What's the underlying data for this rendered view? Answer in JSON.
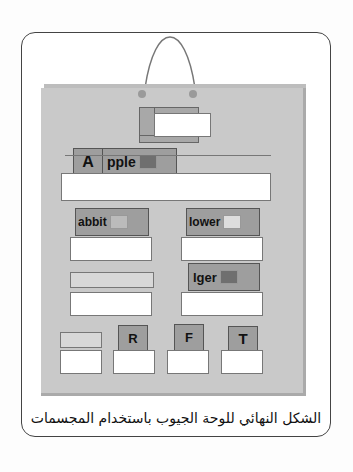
{
  "caption": "الشكل النهائي للوحة الجيوب باستخدام المجسمات",
  "cards": {
    "apple_letter": "A",
    "apple_rest": "pple",
    "rabbit": "abbit",
    "flower": "lower",
    "tiger": "lger",
    "r": "R",
    "f": "F",
    "t": "T"
  },
  "colors": {
    "board": "#c9c9c9",
    "card": "#9e9e9e",
    "pocket": "#ffffff"
  }
}
